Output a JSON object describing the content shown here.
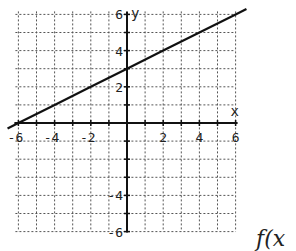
{
  "chart_data": {
    "type": "line",
    "title": "",
    "xlabel": "x",
    "ylabel": "y",
    "xlim": [
      -6,
      6
    ],
    "ylim": [
      -6,
      6
    ],
    "grid": true,
    "grid_step": 1,
    "x_ticks": [
      -6,
      -4,
      -2,
      2,
      4,
      6
    ],
    "y_ticks": [
      6,
      4,
      2,
      -4,
      -6
    ],
    "x_tick_labels": [
      "-6",
      "-4",
      "-2",
      "2",
      "4",
      "6"
    ],
    "y_tick_labels": [
      "6",
      "4",
      "2",
      "-4",
      "-6"
    ],
    "series": [
      {
        "name": "line",
        "equation": "y = 0.5x + 3",
        "slope": 0.5,
        "intercept": 3,
        "x": [
          -6.6,
          -6,
          -4,
          -2,
          0,
          2,
          4,
          6,
          6.6
        ],
        "y": [
          -0.3,
          0,
          1,
          2,
          3,
          4,
          5,
          6,
          6.3
        ]
      }
    ],
    "annotation": "f(x"
  },
  "labels": {
    "x_axis": "x",
    "y_axis": "y",
    "function": "f(x"
  }
}
